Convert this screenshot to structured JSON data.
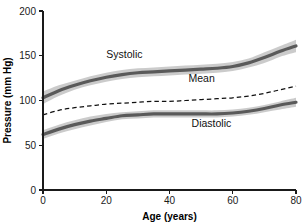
{
  "chart_data": {
    "type": "line",
    "title": "",
    "xlabel": "Age (years)",
    "ylabel": "Pressure (mm Hg)",
    "xlim": [
      0,
      80
    ],
    "ylim": [
      0,
      200
    ],
    "xticks": [
      0,
      20,
      40,
      60,
      80
    ],
    "yticks": [
      0,
      50,
      100,
      150,
      200
    ],
    "xtick_labels": [
      "0",
      "20",
      "40",
      "60",
      "80"
    ],
    "ytick_labels": [
      "0",
      "50",
      "100",
      "150",
      "200"
    ],
    "grid": false,
    "legend_position": "inline-annotations",
    "x": [
      0,
      5,
      10,
      15,
      20,
      25,
      30,
      35,
      40,
      45,
      50,
      55,
      60,
      65,
      70,
      75,
      80
    ],
    "series": [
      {
        "name": "Systolic",
        "style": "solid-band",
        "color": "#5a5a5a",
        "band_color": "#c2c2c2",
        "label_x": 20,
        "label_y": 147,
        "values": [
          103,
          111,
          117,
          122,
          126,
          129,
          131,
          132,
          133,
          134,
          135,
          136,
          138,
          142,
          148,
          155,
          161
        ],
        "band_lower": [
          96,
          105,
          112,
          117,
          121,
          124,
          126,
          127,
          128,
          129,
          130,
          131,
          133,
          137,
          142,
          149,
          154
        ],
        "band_upper": [
          110,
          117,
          122,
          127,
          131,
          134,
          136,
          137,
          138,
          139,
          140,
          141,
          143,
          147,
          154,
          161,
          168
        ]
      },
      {
        "name": "Mean",
        "style": "dashed",
        "color": "#111111",
        "label_x": 46,
        "label_y": 121,
        "values": [
          84,
          89,
          92,
          94,
          96,
          97,
          98,
          99,
          99,
          100,
          101,
          102,
          103,
          105,
          108,
          112,
          116
        ]
      },
      {
        "name": "Diastolic",
        "style": "solid-band",
        "color": "#5a5a5a",
        "band_color": "#c2c2c2",
        "label_x": 47,
        "label_y": 70,
        "values": [
          62,
          68,
          73,
          77,
          80,
          83,
          84,
          85,
          85,
          85,
          85,
          85,
          86,
          88,
          91,
          95,
          98
        ],
        "band_lower": [
          57,
          63,
          68,
          72,
          76,
          79,
          80,
          81,
          81,
          81,
          81,
          81,
          82,
          84,
          87,
          90,
          93
        ],
        "band_upper": [
          67,
          73,
          78,
          82,
          85,
          87,
          88,
          89,
          89,
          89,
          89,
          89,
          90,
          92,
          95,
          99,
          103
        ]
      }
    ]
  },
  "axes": {
    "x_axis_name": "x-axis",
    "y_axis_name": "y-axis"
  }
}
